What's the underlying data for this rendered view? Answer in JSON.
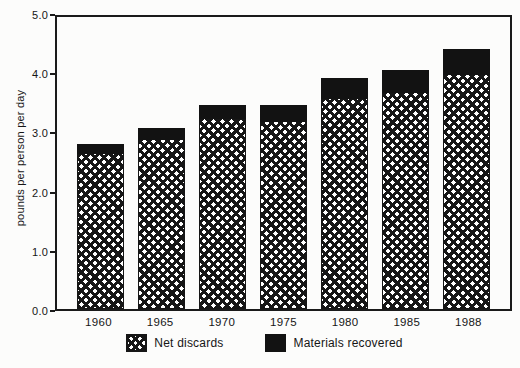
{
  "figure": {
    "background_color": "#fcfcfb",
    "ink_color": "#161616"
  },
  "chart_data": {
    "type": "bar",
    "stacked": true,
    "title": "",
    "xlabel": "",
    "ylabel": "pounds per person per day",
    "ylim": [
      0,
      5
    ],
    "yticks": [
      "0.0",
      "1.0",
      "2.0",
      "3.0",
      "4.0",
      "5.0"
    ],
    "grid": false,
    "legend_position": "bottom",
    "categories": [
      "1960",
      "1965",
      "1970",
      "1975",
      "1980",
      "1985",
      "1988"
    ],
    "series": [
      {
        "name": "Net discards",
        "style": "crosshatch",
        "values": [
          2.65,
          2.9,
          3.25,
          3.2,
          3.6,
          3.7,
          4.0
        ]
      },
      {
        "name": "Materials recovered",
        "style": "solid-black",
        "values": [
          0.18,
          0.2,
          0.25,
          0.3,
          0.35,
          0.4,
          0.45
        ]
      }
    ],
    "totals": [
      2.83,
      3.1,
      3.5,
      3.5,
      3.95,
      4.1,
      4.45
    ]
  }
}
